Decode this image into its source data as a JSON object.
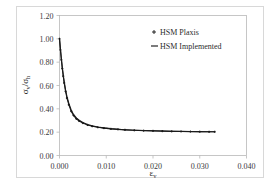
{
  "chart_data": {
    "type": "line",
    "title": "",
    "subtitle": "",
    "xlabel": "εv",
    "xlabel_main": "ε",
    "xlabel_sub": "v",
    "ylabel": "σv/σh",
    "ylabel_parts": [
      "σ",
      "v",
      "/",
      "σ",
      "h"
    ],
    "xlim": [
      0.0,
      0.04
    ],
    "ylim": [
      0.0,
      1.2
    ],
    "xticks": [
      0.0,
      0.01,
      0.02,
      0.03,
      0.04
    ],
    "xtick_labels": [
      "0.000",
      "0.010",
      "0.020",
      "0.030",
      "0.040"
    ],
    "yticks": [
      0.0,
      0.2,
      0.4,
      0.6,
      0.8,
      1.0,
      1.2
    ],
    "ytick_labels": [
      "0.00",
      "0.20",
      "0.40",
      "0.60",
      "0.80",
      "1.00",
      "1.20"
    ],
    "grid": false,
    "legend_position": "top-right",
    "legend": [
      {
        "name": "HSM Plaxis",
        "marker": "plus",
        "style": "markers",
        "color": "#111111"
      },
      {
        "name": "HSM Implemented",
        "marker": "line",
        "style": "line",
        "color": "#111111"
      }
    ],
    "series": [
      {
        "name": "HSM Plaxis",
        "marker": "plus",
        "color": "#111111",
        "x": [
          0.0,
          0.0002,
          0.0004,
          0.0006,
          0.0008,
          0.001,
          0.0013,
          0.0016,
          0.002,
          0.0025,
          0.003,
          0.0036,
          0.0042,
          0.005,
          0.006,
          0.007,
          0.0082,
          0.0095,
          0.011,
          0.0125,
          0.014,
          0.016,
          0.018,
          0.02,
          0.022,
          0.024,
          0.026,
          0.028,
          0.03,
          0.032,
          0.0332
        ],
        "y": [
          1.0,
          0.905,
          0.82,
          0.745,
          0.68,
          0.622,
          0.55,
          0.492,
          0.435,
          0.38,
          0.344,
          0.315,
          0.296,
          0.278,
          0.262,
          0.251,
          0.242,
          0.235,
          0.228,
          0.224,
          0.22,
          0.216,
          0.213,
          0.211,
          0.209,
          0.207,
          0.206,
          0.205,
          0.204,
          0.203,
          0.203
        ]
      },
      {
        "name": "HSM Implemented",
        "marker": "line",
        "color": "#111111",
        "x": [
          0.0,
          0.0002,
          0.0004,
          0.0006,
          0.0008,
          0.001,
          0.0013,
          0.0016,
          0.002,
          0.0025,
          0.003,
          0.0036,
          0.0042,
          0.005,
          0.006,
          0.007,
          0.0082,
          0.0095,
          0.011,
          0.0125,
          0.014,
          0.016,
          0.018,
          0.02,
          0.022,
          0.024,
          0.026,
          0.028,
          0.03,
          0.032,
          0.0332
        ],
        "y": [
          1.005,
          0.912,
          0.83,
          0.757,
          0.692,
          0.635,
          0.562,
          0.504,
          0.446,
          0.39,
          0.352,
          0.322,
          0.302,
          0.283,
          0.266,
          0.254,
          0.245,
          0.237,
          0.23,
          0.225,
          0.221,
          0.217,
          0.214,
          0.212,
          0.21,
          0.208,
          0.207,
          0.206,
          0.205,
          0.204,
          0.204
        ]
      }
    ],
    "colors": {
      "background": "#ffffff",
      "frame": "#b9b9b9",
      "outer_border": "#d8d8d8",
      "series": "#111111",
      "tick_text": "#3a3a3a"
    }
  }
}
